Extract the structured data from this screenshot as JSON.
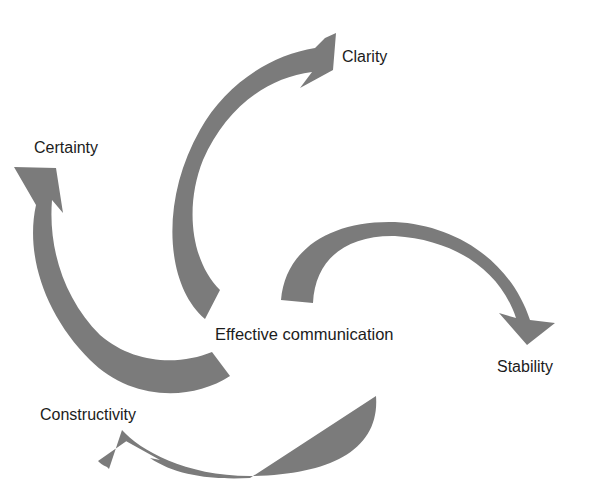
{
  "diagram": {
    "center": "Effective communication",
    "nodes": [
      {
        "id": "clarity",
        "label": "Clarity"
      },
      {
        "id": "certainty",
        "label": "Certainty"
      },
      {
        "id": "stability",
        "label": "Stability"
      },
      {
        "id": "constructivity",
        "label": "Constructivity"
      }
    ],
    "edges": [
      {
        "from": "Effective communication",
        "to": "Clarity"
      },
      {
        "from": "Effective communication",
        "to": "Certainty"
      },
      {
        "from": "Effective communication",
        "to": "Stability"
      },
      {
        "from": "Effective communication",
        "to": "Constructivity"
      }
    ],
    "colors": {
      "arrow": "#7b7b7b",
      "text": "#1c1c1c",
      "background": "#ffffff"
    }
  }
}
